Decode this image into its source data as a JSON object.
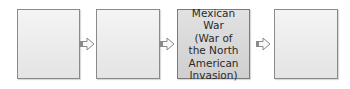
{
  "diagram": {
    "type": "flow",
    "boxes": [
      {
        "id": 1,
        "label": ""
      },
      {
        "id": 2,
        "label": ""
      },
      {
        "id": 3,
        "label": "Mexican War\n(War of\nthe North\nAmerican\nInvasion)"
      },
      {
        "id": 4,
        "label": ""
      }
    ],
    "arrows": [
      {
        "from": 1,
        "to": 2
      },
      {
        "from": 2,
        "to": 3
      },
      {
        "from": 3,
        "to": 4
      }
    ],
    "colors": {
      "box_border": "#8a8a8a",
      "box_fill": "#eaeaea",
      "highlight_fill": "#d8d8d8",
      "arrow": "#8a8a8a"
    }
  }
}
